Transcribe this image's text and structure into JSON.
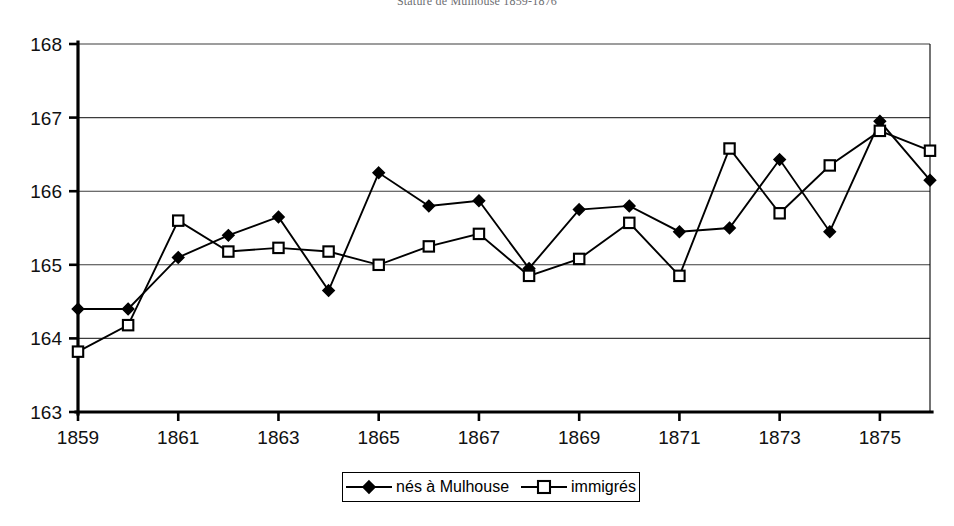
{
  "chart": {
    "title": "Stature de Mulhouse 1859-1876",
    "y_tick_labels": [
      "168",
      "167",
      "166",
      "165",
      "164",
      "163"
    ],
    "x_tick_labels": [
      "1859",
      "1861",
      "1863",
      "1865",
      "1867",
      "1869",
      "1871",
      "1873",
      "1875"
    ],
    "legend": {
      "entries": [
        {
          "label": "nés à Mulhouse",
          "marker": "filled-diamond"
        },
        {
          "label": "immigrés",
          "marker": "open-square"
        }
      ]
    }
  },
  "chart_data": {
    "type": "line",
    "title": "Stature de Mulhouse 1859-1876",
    "xlabel": "",
    "ylabel": "",
    "xlim": [
      1859,
      1876
    ],
    "ylim": [
      163,
      168
    ],
    "grid": true,
    "legend_position": "bottom",
    "x": [
      1859,
      1860,
      1861,
      1862,
      1863,
      1864,
      1865,
      1866,
      1867,
      1868,
      1869,
      1870,
      1871,
      1872,
      1873,
      1874,
      1875,
      1876
    ],
    "x_tick_values": [
      1859,
      1861,
      1863,
      1865,
      1867,
      1869,
      1871,
      1873,
      1875
    ],
    "y_tick_values": [
      163,
      164,
      165,
      166,
      167,
      168
    ],
    "series": [
      {
        "name": "nés à Mulhouse",
        "marker": "filled-diamond",
        "color": "#000000",
        "values": [
          164.4,
          164.4,
          165.1,
          165.4,
          165.65,
          164.65,
          166.25,
          165.8,
          165.87,
          164.95,
          165.75,
          165.8,
          165.45,
          165.5,
          166.43,
          165.45,
          166.95,
          166.15
        ]
      },
      {
        "name": "immigrés",
        "marker": "open-square",
        "color": "#000000",
        "values": [
          163.82,
          164.18,
          165.6,
          165.18,
          165.23,
          165.18,
          165.0,
          165.25,
          165.42,
          164.85,
          165.08,
          165.57,
          164.85,
          166.58,
          165.7,
          166.35,
          166.82,
          166.55
        ]
      }
    ]
  },
  "layout": {
    "plot_left": 78,
    "plot_right": 930,
    "plot_top": 44,
    "plot_bottom": 412
  }
}
